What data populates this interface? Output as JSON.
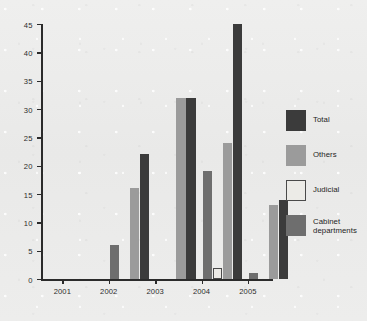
{
  "chart_data": {
    "type": "bar",
    "title": "",
    "subtitle": "",
    "xlabel": "",
    "ylabel": "",
    "categories": [
      "2001",
      "2002",
      "2003",
      "2004",
      "2005"
    ],
    "ylim": [
      0,
      45
    ],
    "yticks": [
      0,
      5,
      10,
      15,
      20,
      25,
      30,
      35,
      40,
      45
    ],
    "ytick_labels": [
      "0",
      "5",
      "10",
      "15",
      "20",
      "25",
      "30",
      "35",
      "40",
      "45"
    ],
    "grid": false,
    "legend_position": "right",
    "series": [
      {
        "name": "Cabinet departments",
        "color": "#6e6e6e",
        "values": [
          0,
          6,
          0,
          19,
          1
        ]
      },
      {
        "name": "Judicial",
        "color": "#ecebe7",
        "values": [
          0,
          0,
          0,
          2,
          0
        ]
      },
      {
        "name": "Others",
        "color": "#9b9b9b",
        "values": [
          0,
          16,
          32,
          24,
          13
        ]
      },
      {
        "name": "Total",
        "color": "#3b3b3b",
        "values": [
          0,
          22,
          32,
          45,
          14
        ]
      }
    ]
  },
  "legend": {
    "items": [
      {
        "label": "Total",
        "color": "#3b3b3b"
      },
      {
        "label": "Others",
        "color": "#9b9b9b"
      },
      {
        "label": "Judicial",
        "color": "#ecebe7"
      },
      {
        "label": "Cabinet departments",
        "color": "#6e6e6e"
      }
    ]
  },
  "axes": {
    "axis_color": "#2b2b2b",
    "tick_text_color": "#2c2c2c"
  },
  "background": {
    "color": "#ececeb"
  }
}
